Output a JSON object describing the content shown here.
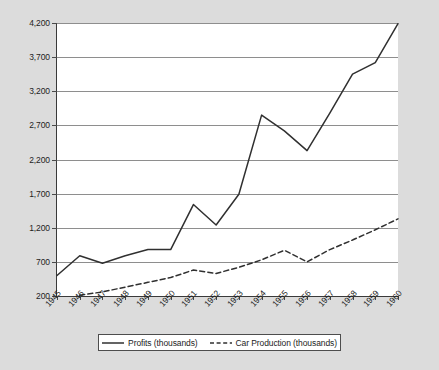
{
  "chart_data": {
    "type": "line",
    "title": "",
    "subtitle": "",
    "xlabel": "",
    "ylabel": "",
    "grid": true,
    "legend_position": "bottom",
    "categories": [
      "1945",
      "1946",
      "1947",
      "1948",
      "1949",
      "1950",
      "1951",
      "1952",
      "1953",
      "1954",
      "1955",
      "1956",
      "1957",
      "1958",
      "1959",
      "1960"
    ],
    "ylim": [
      200,
      4200
    ],
    "yticks": [
      200,
      700,
      1200,
      1700,
      2200,
      2700,
      3200,
      3700,
      4200
    ],
    "ytick_labels": [
      "200",
      "700",
      "1,200",
      "1,700",
      "2,200",
      "2,700",
      "3,200",
      "3,700",
      "4,200"
    ],
    "series": [
      {
        "name": "Profits (thousands)",
        "style": "solid",
        "color": "#303030",
        "values": [
          500,
          790,
          680,
          790,
          880,
          880,
          1540,
          1240,
          1690,
          2850,
          2620,
          2330,
          2880,
          3450,
          3620,
          4190
        ]
      },
      {
        "name": "Car Production (thousands)",
        "style": "dashed",
        "color": "#303030",
        "values": [
          null,
          210,
          260,
          330,
          400,
          470,
          580,
          530,
          620,
          730,
          870,
          700,
          880,
          1020,
          1170,
          1330
        ]
      }
    ]
  },
  "legend": {
    "entries": [
      {
        "label": "Profits (thousands)",
        "icon": "solid-line-icon"
      },
      {
        "label": "Car Production (thousands)",
        "icon": "dashed-line-icon"
      }
    ]
  },
  "colors": {
    "background": "#dcdcdc",
    "plot_background": "#ffffff",
    "gridline": "#8e8e8e",
    "axis": "#3a3a3a",
    "series_line": "#303030",
    "text": "#1c1c1c"
  }
}
